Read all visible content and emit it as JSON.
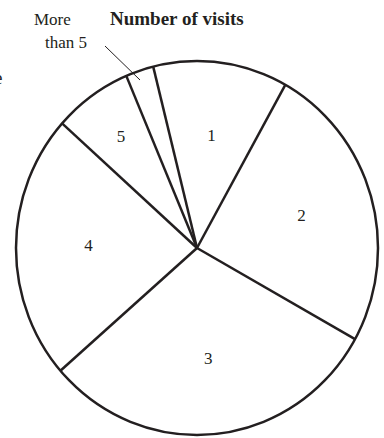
{
  "chart_data": {
    "type": "pie",
    "title": "Number of visits",
    "categories": [
      "1",
      "2",
      "3",
      "4",
      "5",
      "More than 5"
    ],
    "values": [
      12,
      25,
      30.5,
      23,
      7,
      2.5
    ],
    "units": "percent (estimated from slice angles)",
    "start_angle_deg": 346,
    "direction": "clockwise",
    "fill": "none",
    "stroke": "#231f20",
    "legend": "none",
    "annotations": [
      {
        "text": "More than 5",
        "points_to": "More than 5",
        "type": "leader-line"
      }
    ]
  },
  "title": "Number of visits",
  "callout": {
    "line1": "More",
    "line2": "than 5"
  },
  "edge_fragment": "e",
  "labels": [
    "1",
    "2",
    "3",
    "4",
    "5"
  ]
}
